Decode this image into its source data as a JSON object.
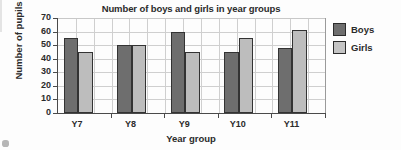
{
  "chart_data": {
    "type": "bar",
    "title": "Number of boys and girls in year groups",
    "xlabel": "Year group",
    "ylabel": "Number of pupils",
    "categories": [
      "Y7",
      "Y8",
      "Y9",
      "Y10",
      "Y11"
    ],
    "series": [
      {
        "name": "Boys",
        "values": [
          55,
          50,
          60,
          45,
          48
        ],
        "color": "#6e6e6e"
      },
      {
        "name": "Girls",
        "values": [
          45,
          50,
          45,
          55,
          61
        ],
        "color": "#bdbdbd"
      }
    ],
    "ylim": [
      0,
      70
    ],
    "ytick_step": 10,
    "yticks": [
      70,
      60,
      50,
      40,
      30,
      20,
      10,
      0
    ],
    "ytick_labels": [
      "70",
      "60",
      "50",
      "40",
      "30",
      "20",
      "10",
      "0"
    ],
    "grid": "both",
    "grid_vertical_columns": 15,
    "legend_position": "right",
    "legend": [
      "Boys",
      "Girls"
    ],
    "bar_outline_color": "#333333",
    "axis_color": "#4a4a4a",
    "grid_color": "#cfcfcf"
  }
}
